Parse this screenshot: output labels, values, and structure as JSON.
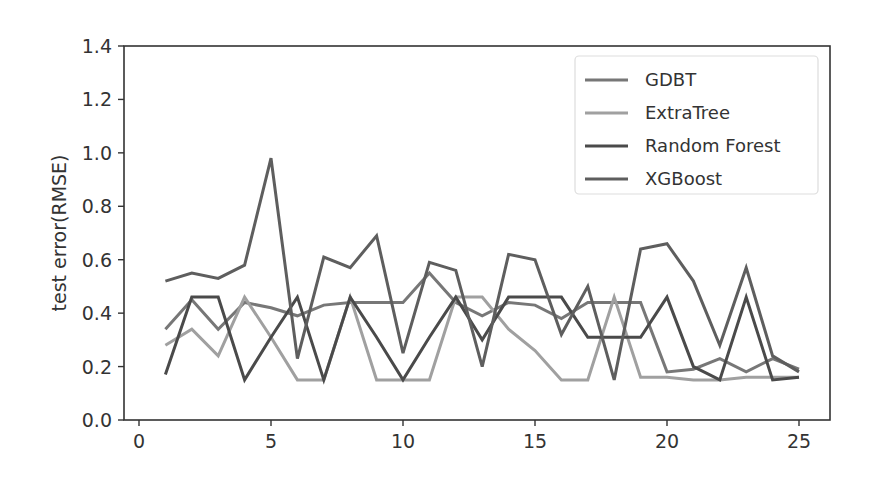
{
  "chart_data": {
    "type": "line",
    "title": "",
    "xlabel": "",
    "ylabel": "test error(RMSE)",
    "xlim": [
      -0.2,
      26.2
    ],
    "ylim": [
      0.0,
      1.4
    ],
    "xticks": [
      0,
      5,
      10,
      15,
      20,
      25
    ],
    "xtick_labels": [
      "0",
      "5",
      "10",
      "15",
      "20",
      "25"
    ],
    "yticks": [
      0.0,
      0.2,
      0.4,
      0.6,
      0.8,
      1.0,
      1.2,
      1.4
    ],
    "ytick_labels": [
      "0.0",
      "0.2",
      "0.4",
      "0.6",
      "0.8",
      "1.0",
      "1.2",
      "1.4"
    ],
    "grid": false,
    "legend_position": "upper right",
    "x": [
      1,
      2,
      3,
      4,
      5,
      6,
      7,
      8,
      9,
      10,
      11,
      12,
      13,
      14,
      15,
      16,
      17,
      18,
      19,
      20,
      21,
      22,
      23,
      24,
      25
    ],
    "series": [
      {
        "name": "GDBT",
        "color": "#777777",
        "values": [
          0.34,
          0.45,
          0.34,
          0.44,
          0.42,
          0.39,
          0.43,
          0.44,
          0.44,
          0.44,
          0.55,
          0.44,
          0.39,
          0.44,
          0.43,
          0.38,
          0.44,
          0.44,
          0.44,
          0.18,
          0.19,
          0.23,
          0.18,
          0.23,
          0.19
        ]
      },
      {
        "name": "ExtraTree",
        "color": "#a0a0a0",
        "values": [
          0.28,
          0.34,
          0.24,
          0.46,
          0.31,
          0.15,
          0.15,
          0.46,
          0.15,
          0.15,
          0.15,
          0.46,
          0.46,
          0.34,
          0.26,
          0.15,
          0.15,
          0.46,
          0.16,
          0.16,
          0.15,
          0.15,
          0.16,
          0.16,
          0.16
        ]
      },
      {
        "name": "Random Forest",
        "color": "#4a4a4a",
        "values": [
          0.17,
          0.46,
          0.46,
          0.15,
          0.31,
          0.46,
          0.15,
          0.46,
          0.31,
          0.15,
          0.31,
          0.46,
          0.3,
          0.46,
          0.46,
          0.46,
          0.31,
          0.31,
          0.31,
          0.46,
          0.2,
          0.15,
          0.46,
          0.15,
          0.16
        ]
      },
      {
        "name": "XGBoost",
        "color": "#5e5e5e",
        "values": [
          0.52,
          0.55,
          0.53,
          0.58,
          0.98,
          0.23,
          0.61,
          0.57,
          0.69,
          0.25,
          0.59,
          0.56,
          0.2,
          0.62,
          0.6,
          0.32,
          0.5,
          0.15,
          0.64,
          0.66,
          0.52,
          0.28,
          0.57,
          0.24,
          0.18
        ]
      }
    ]
  }
}
